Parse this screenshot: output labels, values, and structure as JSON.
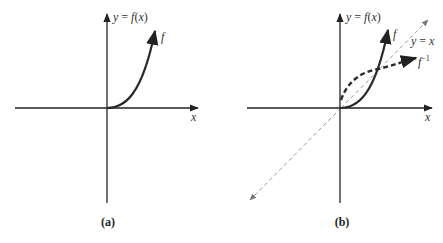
{
  "figure": {
    "panels": [
      {
        "id": "a",
        "caption": "(a)",
        "y_axis_label": "y = f(x)",
        "x_axis_label": "x",
        "curves": [
          {
            "name": "f",
            "label": "f",
            "style": "solid"
          }
        ]
      },
      {
        "id": "b",
        "caption": "(b)",
        "y_axis_label": "y = f(x)",
        "x_axis_label": "x",
        "curves": [
          {
            "name": "f",
            "label": "f",
            "style": "solid"
          },
          {
            "name": "f-inverse",
            "label": "f",
            "superscript": "−1",
            "style": "dashed-thick"
          },
          {
            "name": "identity",
            "label": "y = x",
            "style": "dashed-thin"
          }
        ]
      }
    ],
    "colors": {
      "axis": "#222222",
      "curve": "#2a2a2a",
      "identity_line": "#9a9a9a",
      "background": "#ffffff"
    }
  }
}
